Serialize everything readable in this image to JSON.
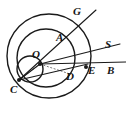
{
  "figure": {
    "kind": "geometry-diagram",
    "background_color": "#ffffff",
    "stroke_color": "#1a1a1a",
    "dashed_stroke_color": "#555555",
    "label_color": "#151515",
    "canvas": {
      "width": 126,
      "height": 121
    },
    "points": [
      {
        "id": "G",
        "label": "G",
        "label_x": 73,
        "label_y": 6,
        "x": 88,
        "y": 17,
        "marked": false
      },
      {
        "id": "A",
        "label": "A",
        "label_x": 56,
        "label_y": 32,
        "x": 62,
        "y": 44,
        "marked": false
      },
      {
        "id": "S",
        "label": "S",
        "label_x": 105,
        "label_y": 39,
        "x": 118,
        "y": 48,
        "marked": false
      },
      {
        "id": "O",
        "label": "O",
        "label_x": 32,
        "label_y": 49,
        "x": 40,
        "y": 64,
        "marked": true
      },
      {
        "id": "D",
        "label": "D",
        "label_x": 66,
        "label_y": 71,
        "x": 70,
        "y": 72,
        "marked": false
      },
      {
        "id": "E",
        "label": "E",
        "label_x": 88,
        "label_y": 65,
        "x": 86,
        "y": 67,
        "marked": true
      },
      {
        "id": "B",
        "label": "B",
        "label_x": 107,
        "label_y": 65,
        "x": 124,
        "y": 66,
        "marked": false
      },
      {
        "id": "C",
        "label": "C",
        "label_x": 10,
        "label_y": 84,
        "x": 19,
        "y": 80,
        "marked": true
      }
    ],
    "circles": [
      {
        "id": "outer-circle",
        "cx": 49,
        "cy": 56,
        "r": 42,
        "stroke_width": 1.4
      },
      {
        "id": "middle-circle",
        "cx": 46,
        "cy": 58,
        "r": 29,
        "stroke_width": 1.4
      },
      {
        "id": "small-circle",
        "cx": 30,
        "cy": 69,
        "r": 13,
        "stroke_width": 1.4
      }
    ],
    "solid_lines": [
      {
        "id": "ray-C-to-G",
        "x1": 19,
        "y1": 80,
        "x2": 96,
        "y2": 10
      },
      {
        "id": "ray-O-to-S",
        "x1": 40,
        "y1": 64,
        "x2": 120,
        "y2": 44
      },
      {
        "id": "ray-O-to-B",
        "x1": 40,
        "y1": 64,
        "x2": 126,
        "y2": 62
      },
      {
        "id": "chord-C-to-E",
        "x1": 19,
        "y1": 80,
        "x2": 88,
        "y2": 64
      },
      {
        "id": "segment-O-to-C",
        "x1": 40,
        "y1": 64,
        "x2": 19,
        "y2": 80
      }
    ],
    "dashed_lines": [
      {
        "id": "dashed-O-to-C",
        "x1": 40,
        "y1": 64,
        "x2": 19,
        "y2": 80
      },
      {
        "id": "dashed-O-to-D",
        "x1": 40,
        "y1": 64,
        "x2": 70,
        "y2": 74
      }
    ]
  }
}
